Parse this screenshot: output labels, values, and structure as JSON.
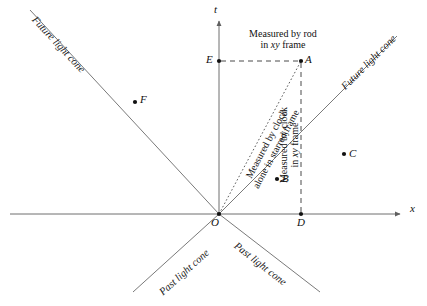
{
  "figure": {
    "type": "spacetime-minkowski-diagram",
    "background_color": "#ffffff",
    "line_color": "#6b6b6b",
    "text_color": "#111111"
  },
  "axes": {
    "t_label": "t",
    "x_label": "x",
    "origin_label": "O"
  },
  "light_cones": {
    "future_left": "Future light cone",
    "future_right": "Future light cone",
    "past_left": "Past light cone",
    "past_right": "Past light cone"
  },
  "events": [
    {
      "id": "A",
      "label": "A",
      "x": 301,
      "y": 61
    },
    {
      "id": "B",
      "label": "B",
      "x": 277,
      "y": 179
    },
    {
      "id": "C",
      "label": "C",
      "x": 344,
      "y": 154
    },
    {
      "id": "D",
      "label": "D",
      "x": 301,
      "y": 214
    },
    {
      "id": "E",
      "label": "E",
      "x": 219,
      "y": 61
    },
    {
      "id": "F",
      "label": "F",
      "x": 135,
      "y": 102
    },
    {
      "id": "O",
      "label": "O",
      "x": 219,
      "y": 214
    }
  ],
  "annotations": {
    "rod": {
      "line1": "Measured by rod",
      "line2_pre": "in ",
      "line2_italic": "xy",
      "line2_post": " frame"
    },
    "clock_starred": {
      "line1": "Measured by clock",
      "line2": "alone in starred frame"
    },
    "clock_xy": {
      "line1": "Measured by clock",
      "line2_pre": "in ",
      "line2_italic": "xy",
      "line2_post": " frame"
    }
  }
}
